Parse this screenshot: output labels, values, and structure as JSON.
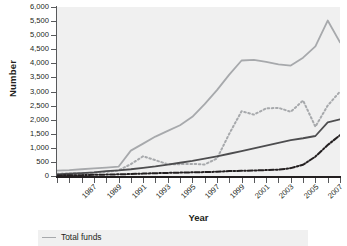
{
  "axes": {
    "ylabel": "Number",
    "xlabel": "Year",
    "yticks": [
      "6,000",
      "5,500",
      "5,000",
      "4,500",
      "4,000",
      "3,500",
      "3,000",
      "2,500",
      "2,000",
      "1,500",
      "1,000",
      "500",
      "0"
    ],
    "xticks": [
      "1987",
      "1989",
      "1991",
      "1993",
      "1995",
      "1997",
      "1999",
      "2001",
      "2003",
      "2005",
      "2007",
      "2009"
    ]
  },
  "legend": {
    "entries": [
      {
        "label": "Total funds",
        "color": "#a7a9ac",
        "style": "solid"
      }
    ]
  },
  "colors": {
    "plot_background": "#f0f0f0",
    "axis": "#231f20",
    "tick": "#58595b",
    "total_funds": "#a7a9ac",
    "series_gray_dotted": "#a7a9ac",
    "series_dark_solid": "#4d4d4f",
    "series_dark_dashdot": "#231f20"
  },
  "chart_data": {
    "type": "line",
    "title": "",
    "xlabel": "Year",
    "ylabel": "Number",
    "xlim": [
      1986,
      2009
    ],
    "ylim": [
      0,
      6000
    ],
    "ytick_step": 500,
    "grid": false,
    "legend_position": "bottom-left",
    "x": [
      1986,
      1987,
      1988,
      1989,
      1990,
      1991,
      1992,
      1993,
      1994,
      1995,
      1996,
      1997,
      1998,
      1999,
      2000,
      2001,
      2002,
      2003,
      2004,
      2005,
      2006,
      2007,
      2008,
      2009
    ],
    "series": [
      {
        "name": "Total funds",
        "color": "#a7a9ac",
        "style": "solid",
        "values": [
          190,
          210,
          240,
          270,
          300,
          330,
          900,
          1150,
          1400,
          1600,
          1800,
          2100,
          2550,
          3050,
          3600,
          4100,
          4120,
          4050,
          3960,
          3920,
          4200,
          4600,
          5520,
          4750
        ]
      },
      {
        "name": "Series 2",
        "color": "#a7a9ac",
        "style": "dotted",
        "values": [
          80,
          90,
          100,
          120,
          150,
          200,
          420,
          700,
          560,
          420,
          420,
          430,
          410,
          620,
          1500,
          2300,
          2180,
          2400,
          2420,
          2280,
          2680,
          1750,
          2500,
          3000
        ]
      },
      {
        "name": "Series 3",
        "color": "#4d4d4f",
        "style": "solid",
        "values": [
          60,
          80,
          100,
          130,
          170,
          200,
          240,
          290,
          340,
          400,
          470,
          540,
          620,
          700,
          790,
          880,
          980,
          1080,
          1180,
          1270,
          1340,
          1420,
          1900,
          2010
        ]
      },
      {
        "name": "Series 4",
        "color": "#231f20",
        "style": "dash-dot",
        "values": [
          20,
          25,
          30,
          40,
          50,
          60,
          70,
          85,
          100,
          110,
          120,
          130,
          140,
          150,
          175,
          185,
          195,
          210,
          225,
          280,
          400,
          690,
          1100,
          1450
        ]
      }
    ],
    "annotations": {
      "note": "Legend is cropped at the bottom of the screenshot; only the first entry 'Total funds' is visible."
    }
  }
}
